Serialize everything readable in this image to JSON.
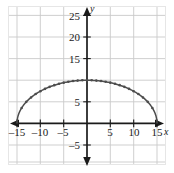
{
  "chart_data": {
    "type": "line",
    "title": "",
    "subtitle": "",
    "xlabel": "x",
    "ylabel": "y",
    "xlim": [
      -20,
      20
    ],
    "ylim": [
      -8,
      28
    ],
    "grid": true,
    "grid_step_x": 5,
    "grid_step_y": 5,
    "legend": "none",
    "x_ticks": [
      -15,
      -10,
      -5,
      5,
      10,
      15
    ],
    "x_tick_labels": [
      "–15",
      "–10",
      "–5",
      "5",
      "10",
      "15"
    ],
    "y_ticks": [
      -5,
      5,
      15,
      20,
      25
    ],
    "y_tick_labels": [
      "–5",
      "5",
      "15",
      "20",
      "25"
    ],
    "curve_description": "upper half of an ellipse with x-intercepts at -15 and 15 and vertex at (0, 10)",
    "x_intercepts": [
      -15,
      15
    ],
    "vertex": [
      0,
      10
    ],
    "semi_axis_x": 15,
    "semi_axis_y": 10,
    "markers_shown": true,
    "series": [
      {
        "name": "curve",
        "color": "#4d4d4d",
        "x": [
          -15,
          -14,
          -13,
          -12,
          -11,
          -10,
          -9,
          -8,
          -7,
          -6,
          -5,
          -4,
          -3,
          -2,
          -1,
          0,
          1,
          2,
          3,
          4,
          5,
          6,
          7,
          8,
          9,
          10,
          11,
          12,
          13,
          14,
          15
        ],
        "y": [
          0.0,
          3.55,
          4.99,
          6.0,
          6.79,
          7.45,
          8.0,
          8.46,
          8.85,
          9.17,
          9.43,
          9.64,
          9.8,
          9.91,
          9.98,
          10.0,
          9.98,
          9.91,
          9.8,
          9.64,
          9.43,
          9.17,
          8.85,
          8.46,
          8.0,
          7.45,
          6.79,
          6.0,
          4.99,
          3.55,
          0.0
        ]
      }
    ]
  },
  "axes": {
    "x_axis_label": "x",
    "y_axis_label": "y"
  },
  "colors": {
    "curve": "#4d4d4d",
    "axis": "#1a1a1a",
    "grid": "#c9c9c9",
    "background": "#ffffff",
    "frame": "#e2e2e2"
  }
}
